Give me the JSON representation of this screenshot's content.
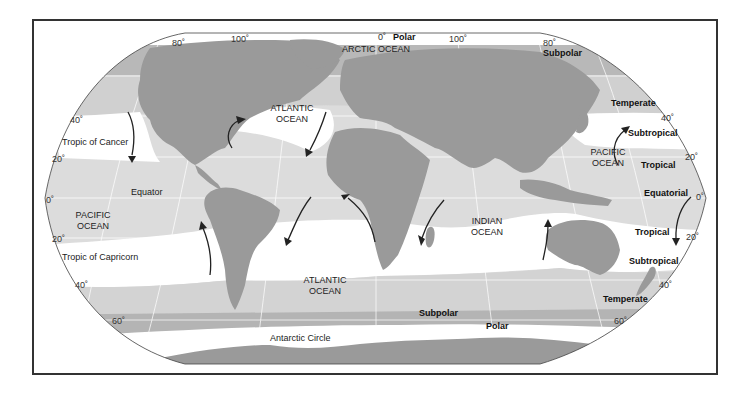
{
  "map": {
    "title": "World Ocean Climate Zones",
    "colors": {
      "land": "#9a9a9a",
      "ocean_tropical": "#dcdcdc",
      "ocean_subtropical": "#ffffff",
      "ocean_temperate": "#d2d2d2",
      "ocean_subpolar": "#b4b4b4",
      "ocean_polar": "#ffffff",
      "frame": "#333333",
      "arrow": "#222222"
    },
    "oceans": [
      {
        "name": "ARCTIC OCEAN"
      },
      {
        "line1": "ATLANTIC",
        "line2": "OCEAN"
      },
      {
        "line1": "PACIFIC",
        "line2": "OCEAN"
      },
      {
        "line1": "PACIFIC",
        "line2": "OCEAN"
      },
      {
        "line1": "INDIAN",
        "line2": "OCEAN"
      },
      {
        "line1": "ATLANTIC",
        "line2": "OCEAN"
      }
    ],
    "reference_lines": {
      "tropic_cancer": "Tropic of Cancer",
      "equator": "Equator",
      "tropic_capricorn": "Tropic of Capricorn",
      "antarctic_circle": "Antarctic Circle"
    },
    "zones": {
      "polar_north": "Polar",
      "subpolar_north": "Subpolar",
      "temperate_north": "Temperate",
      "subtropical_north": "Subtropical",
      "tropical_north": "Tropical",
      "equatorial": "Equatorial",
      "tropical_south": "Tropical",
      "subtropical_south": "Subtropical",
      "temperate_south": "Temperate",
      "subpolar_south": "Subpolar",
      "polar_south": "Polar"
    },
    "longitudes": {
      "l80w": "80˚",
      "l100w": "100˚",
      "l0": "0˚",
      "l100e": "100˚",
      "l80e": "80˚"
    },
    "latitudes_left": {
      "n40": "40˚",
      "n20": "20˚",
      "eq": "0˚",
      "s20": "20˚",
      "s40": "40˚",
      "s60": "60˚"
    },
    "latitudes_right": {
      "n40": "40˚",
      "n20": "20˚",
      "eq": "0˚",
      "s20": "20˚",
      "s40": "40˚",
      "s60": "60˚"
    }
  }
}
